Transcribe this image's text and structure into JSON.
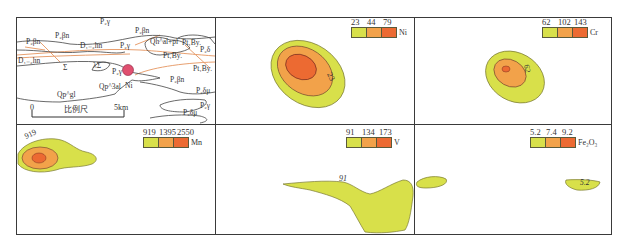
{
  "colors": {
    "low": "#d8e04a",
    "mid": "#f2a24a",
    "high": "#ec6a32",
    "fault": "#e8a070",
    "outline": "#444444"
  },
  "geology_panel": {
    "labels": [
      {
        "text": "P₂γ",
        "x": 100,
        "y": 24
      },
      {
        "text": "P₂βn",
        "x": 135,
        "y": 33
      },
      {
        "text": "P₂βn",
        "x": 55,
        "y": 38
      },
      {
        "text": "P₂βn",
        "x": 26,
        "y": 44
      },
      {
        "text": "D₁₋₂hn",
        "x": 80,
        "y": 48
      },
      {
        "text": "P₂γ",
        "x": 120,
        "y": 48
      },
      {
        "text": "Qh^al+pl",
        "x": 150,
        "y": 44
      },
      {
        "text": "Pt₁By.",
        "x": 182,
        "y": 45
      },
      {
        "text": "P₂δ",
        "x": 200,
        "y": 52
      },
      {
        "text": "Pt₁By.",
        "x": 163,
        "y": 58
      },
      {
        "text": "D₁₋₂hn",
        "x": 18,
        "y": 63
      },
      {
        "text": "Σ",
        "x": 63,
        "y": 70
      },
      {
        "text": "λΣ",
        "x": 93,
        "y": 68
      },
      {
        "text": "Pt₁By.",
        "x": 193,
        "y": 71
      },
      {
        "text": "P₂γ",
        "x": 112,
        "y": 74
      },
      {
        "text": "Ni",
        "x": 125,
        "y": 88
      },
      {
        "text": "P₂βn",
        "x": 170,
        "y": 82
      },
      {
        "text": "Qp^gl",
        "x": 57,
        "y": 97
      },
      {
        "text": "Qp^3al",
        "x": 99,
        "y": 89
      },
      {
        "text": "P₂δμ",
        "x": 196,
        "y": 93
      },
      {
        "text": "P₂γ",
        "x": 200,
        "y": 108
      },
      {
        "text": "P₂δμ",
        "x": 183,
        "y": 115
      }
    ],
    "scale_bar": {
      "start_label": "0",
      "end_label": "5km",
      "title": "比例尺"
    },
    "deposit_marker": {
      "label": "Ni",
      "color": "#e05070"
    }
  },
  "anomaly_panels": [
    {
      "element": "Ni",
      "thresholds": [
        "23",
        "44",
        "79"
      ],
      "contour_label": "23"
    },
    {
      "element": "Cr",
      "thresholds": [
        "62",
        "102",
        "143"
      ],
      "contour_label": "62"
    },
    {
      "element": "Mn",
      "thresholds": [
        "919",
        "1395",
        "2550"
      ],
      "contour_label": "919"
    },
    {
      "element": "V",
      "thresholds": [
        "91",
        "134",
        "173"
      ],
      "contour_label": "91"
    },
    {
      "element": "Fe₂O₃",
      "thresholds": [
        "5.2",
        "7.4",
        "9.2"
      ],
      "contour_label": "5.2"
    }
  ]
}
